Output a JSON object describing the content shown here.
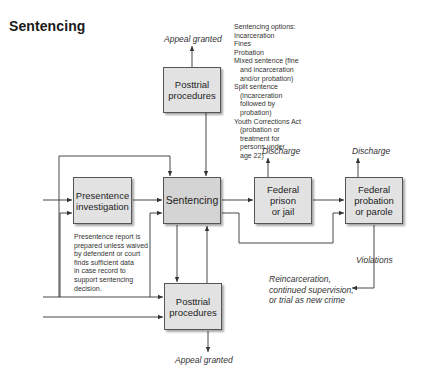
{
  "title": "Sentencing",
  "boxes": {
    "posttrial_top": "Posttrial\nprocedures",
    "presentence": "Presentence\ninvestigation",
    "sentencing": "Sentencing",
    "federal_prison": "Federal\nprison\nor jail",
    "federal_probation": "Federal\nprobation\nor parole",
    "posttrial_bottom": "Posttrial\nprocedures"
  },
  "labels": {
    "appeal_granted_top": "Appeal granted",
    "appeal_granted_bottom": "Appeal granted",
    "discharge_prison": "Discharge",
    "discharge_probation": "Discharge",
    "violations": "Violations"
  },
  "sentencing_options": {
    "heading": "Sentencing options:",
    "lines": [
      {
        "text": "Incarceration",
        "indent": false
      },
      {
        "text": "Fines",
        "indent": false
      },
      {
        "text": "Probation",
        "indent": false
      },
      {
        "text": "Mixed sentence (fine",
        "indent": false
      },
      {
        "text": "and incarceration",
        "indent": true
      },
      {
        "text": "and/or probation)",
        "indent": true
      },
      {
        "text": "Split sentence",
        "indent": false
      },
      {
        "text": "(incarceration",
        "indent": true
      },
      {
        "text": "followed by",
        "indent": true
      },
      {
        "text": "probation)",
        "indent": true
      },
      {
        "text": "Youth Corrections Act",
        "indent": false
      },
      {
        "text": "(probation or",
        "indent": true
      },
      {
        "text": "treatment for",
        "indent": true
      },
      {
        "text": "persons under",
        "indent": true
      },
      {
        "text": "age 22)",
        "indent": true
      }
    ]
  },
  "presentence_note": [
    "Presentence report is",
    "prepared unless waived",
    "by defendent or court",
    "finds sufficient data",
    "in case record to",
    "support sentencing",
    "decision."
  ],
  "violation_outcome": [
    "Reincarceration,",
    "continued supervision,",
    "or trial as new crime"
  ],
  "colors": {
    "box_fill": "#e2e2e2",
    "sentencing_fill": "#d4d4d4",
    "line": "#333333"
  }
}
